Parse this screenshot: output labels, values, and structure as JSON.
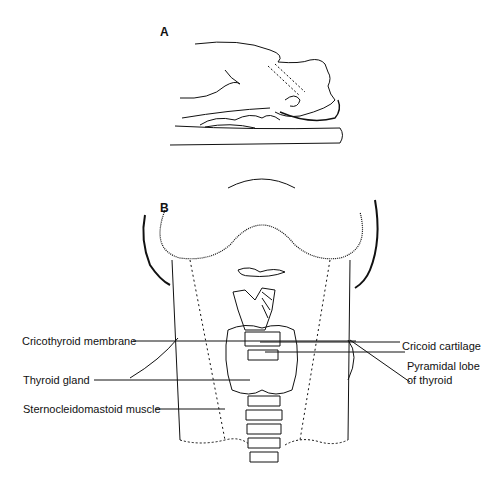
{
  "figure": {
    "panels": [
      {
        "id": "A",
        "label": "A",
        "description": "Patient supine with neck extended over rolled towel"
      },
      {
        "id": "B",
        "label": "B",
        "description": "Anterior view of neck anatomy"
      }
    ],
    "labels": {
      "cricothyroid_membrane": "Cricothyroid membrane",
      "thyroid_gland": "Thyroid gland",
      "sternocleidomastoid_muscle": "Sternocleidomastoid muscle",
      "cricoid_cartilage": "Cricoid cartilage",
      "pyramidal_lobe_line1": "Pyramidal lobe",
      "pyramidal_lobe_line2": "of thyroid"
    }
  }
}
